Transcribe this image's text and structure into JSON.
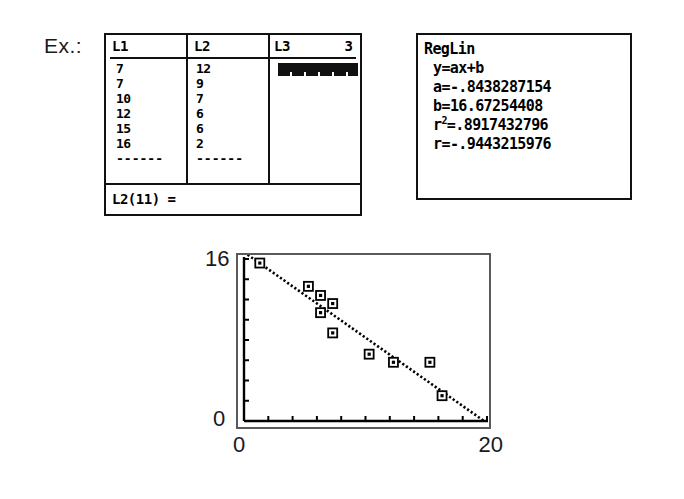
{
  "example_label": "Ex.:",
  "list_editor": {
    "columns": [
      {
        "header": "L1",
        "values": [
          "7",
          "7",
          "10",
          "12",
          "15",
          "16"
        ]
      },
      {
        "header": "L2",
        "values": [
          "12",
          "9",
          "7",
          "6",
          "6",
          "2"
        ]
      },
      {
        "header": "L3",
        "values": []
      }
    ],
    "column_index_indicator": "3",
    "dashes": "------",
    "status_line": "L2(11) =",
    "cursor_column": "L3"
  },
  "regression": {
    "title": "RegLin",
    "model": "y=ax+b",
    "a_label": "a=",
    "a_value": "-.8438287154",
    "b_label": "b=",
    "b_value": "16.67254408",
    "r2_label": "r",
    "r2_sup": "2",
    "r2_eq": "=.8917432796",
    "r_label": "r=",
    "r_value": "-.9443215976"
  },
  "chart_data": {
    "type": "scatter",
    "title": "",
    "xlabel": "",
    "ylabel": "",
    "xlim": [
      0,
      20
    ],
    "ylim": [
      0,
      16
    ],
    "x_tick_labels": [
      "0",
      "20"
    ],
    "y_tick_labels": [
      "0",
      "16"
    ],
    "x_tick_step": 2,
    "y_tick_step": 2,
    "grid": false,
    "legend": false,
    "points": [
      {
        "x": 1.3,
        "y": 15.6
      },
      {
        "x": 5.3,
        "y": 13.3
      },
      {
        "x": 6.3,
        "y": 12.4
      },
      {
        "x": 6.3,
        "y": 10.7
      },
      {
        "x": 7.3,
        "y": 11.6
      },
      {
        "x": 7.3,
        "y": 8.7
      },
      {
        "x": 10.3,
        "y": 6.6
      },
      {
        "x": 12.3,
        "y": 5.8
      },
      {
        "x": 15.3,
        "y": 5.8
      },
      {
        "x": 16.3,
        "y": 2.5
      }
    ],
    "fit_line": {
      "type": "linear",
      "slope": -0.8438287154,
      "intercept": 16.67254408,
      "r": -0.9443215976,
      "r_squared": 0.8917432796
    }
  },
  "colors": {
    "ink": "#111111",
    "frame": "#5a5a5a",
    "background": "#ffffff"
  }
}
